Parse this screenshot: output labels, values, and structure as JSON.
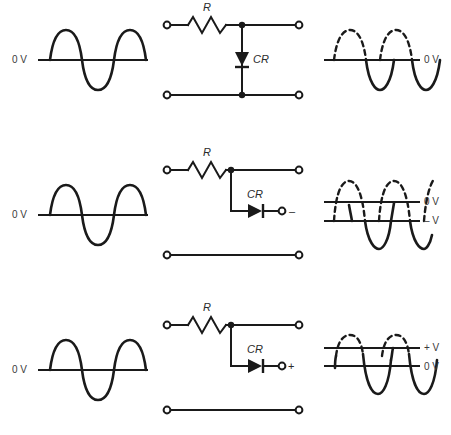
{
  "figure": {
    "caption_fragment": "",
    "colors": {
      "ink": "#1a1a1a",
      "label": "#3a3a3a",
      "background": "#ffffff"
    }
  },
  "labels": {
    "zero_volts": "0 V",
    "minus_volts": "– V",
    "plus_volts": "+ V",
    "resistor": "R",
    "diode": "CR",
    "minus_sign": "–",
    "plus_sign": "+"
  },
  "rows": [
    {
      "id": "row-1",
      "name": "shunt-diode-to-ground",
      "input": {
        "name": "input-waveform",
        "axis_label": "0 V",
        "axis_label_side": "left",
        "cycles": 2,
        "positive_half_style": "solid",
        "negative_half_style": "solid"
      },
      "circuit": {
        "name": "clipper-to-ground",
        "resistor_label": "R",
        "diode_label": "CR",
        "diode_orientation": "vertical-cathode-down",
        "output_terminal_sign": "",
        "bottom_rail": "connected"
      },
      "output": {
        "name": "output-waveform",
        "reference_lines": [
          {
            "label": "0 V",
            "position": "center"
          }
        ],
        "positive_half_style": "dashed",
        "negative_half_style": "solid",
        "description": "Positive half-cycles clipped at 0 V"
      }
    },
    {
      "id": "row-2",
      "name": "diode-to-negative-bias",
      "input": {
        "name": "input-waveform",
        "axis_label": "0 V",
        "axis_label_side": "left",
        "cycles": 2,
        "positive_half_style": "solid",
        "negative_half_style": "solid"
      },
      "circuit": {
        "name": "clipper-to-negative-supply",
        "resistor_label": "R",
        "diode_label": "CR",
        "diode_orientation": "horizontal-cathode-right",
        "output_terminal_sign": "–",
        "bottom_rail": "isolated"
      },
      "output": {
        "name": "output-waveform",
        "reference_lines": [
          {
            "label": "0 V",
            "position": "upper"
          },
          {
            "label": "– V",
            "position": "lower"
          }
        ],
        "positive_half_style": "dashed",
        "negative_half_style": "solid",
        "description": "Waveform clipped at negative bias level"
      }
    },
    {
      "id": "row-3",
      "name": "diode-to-positive-bias",
      "input": {
        "name": "input-waveform",
        "axis_label": "0 V",
        "axis_label_side": "left",
        "cycles": 2,
        "positive_half_style": "solid",
        "negative_half_style": "solid"
      },
      "circuit": {
        "name": "clipper-to-positive-supply",
        "resistor_label": "R",
        "diode_label": "CR",
        "diode_orientation": "horizontal-cathode-right",
        "output_terminal_sign": "+",
        "bottom_rail": "isolated"
      },
      "output": {
        "name": "output-waveform",
        "reference_lines": [
          {
            "label": "+ V",
            "position": "upper"
          },
          {
            "label": "0 V",
            "position": "lower"
          }
        ],
        "positive_half_style": "dashed",
        "negative_half_style": "solid",
        "description": "Waveform clipped at positive bias level"
      }
    }
  ]
}
